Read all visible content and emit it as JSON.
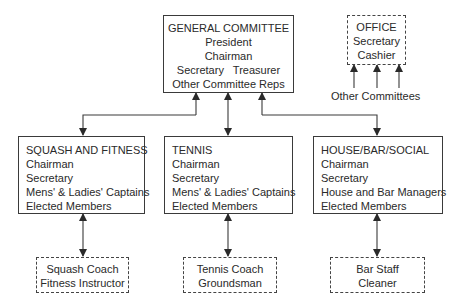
{
  "general_committee": {
    "title": "GENERAL COMMITTEE",
    "lines": [
      "President",
      "Chairman",
      "Secretary   Treasurer",
      "Other Committee Reps"
    ]
  },
  "office": {
    "title": "OFFICE",
    "lines": [
      "Secretary",
      "Cashier"
    ],
    "inputs_label": "Other Committees"
  },
  "committees": [
    {
      "title": "SQUASH AND FITNESS",
      "lines": [
        "Chairman",
        "Secretary",
        "Mens' & Ladies' Captains",
        "Elected Members"
      ],
      "staff": [
        "Squash Coach",
        "Fitness Instructor"
      ]
    },
    {
      "title": "TENNIS",
      "lines": [
        "Chairman",
        "Secretary",
        "Mens' & Ladies' Captains",
        "Elected Members"
      ],
      "staff": [
        "Tennis Coach",
        "Groundsman"
      ]
    },
    {
      "title": "HOUSE/BAR/SOCIAL",
      "lines": [
        "Chairman",
        "Secretary",
        "House and Bar Managers",
        "Elected Members"
      ],
      "staff": [
        "Bar Staff",
        "Cleaner"
      ]
    }
  ],
  "colors": {
    "line": "#3a3a3a",
    "text": "#2a2a2a"
  }
}
